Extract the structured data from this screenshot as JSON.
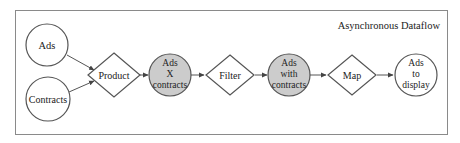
{
  "diagram": {
    "title": "Asynchronous Dataflow",
    "colors": {
      "border": "#888888",
      "stroke": "#555555",
      "highlight_fill": "#cccccc",
      "plain_fill": "#ffffff"
    },
    "nodes": [
      {
        "id": "ads",
        "shape": "circle",
        "lines": [
          "Ads"
        ],
        "highlight": false
      },
      {
        "id": "contracts",
        "shape": "circle",
        "lines": [
          "Contracts"
        ],
        "highlight": false
      },
      {
        "id": "product",
        "shape": "diamond",
        "lines": [
          "Product"
        ],
        "highlight": false
      },
      {
        "id": "ads-x-contracts",
        "shape": "circle",
        "lines": [
          "Ads",
          "X",
          "contracts"
        ],
        "highlight": true
      },
      {
        "id": "filter",
        "shape": "diamond",
        "lines": [
          "Filter"
        ],
        "highlight": false
      },
      {
        "id": "ads-with-contracts",
        "shape": "circle",
        "lines": [
          "Ads",
          "with",
          "contracts"
        ],
        "highlight": true
      },
      {
        "id": "map",
        "shape": "diamond",
        "lines": [
          "Map"
        ],
        "highlight": false
      },
      {
        "id": "ads-to-display",
        "shape": "circle",
        "lines": [
          "Ads",
          "to",
          "display"
        ],
        "highlight": false
      }
    ],
    "edges": [
      {
        "from": "ads",
        "to": "product"
      },
      {
        "from": "contracts",
        "to": "product"
      },
      {
        "from": "product",
        "to": "ads-x-contracts"
      },
      {
        "from": "ads-x-contracts",
        "to": "filter"
      },
      {
        "from": "filter",
        "to": "ads-with-contracts"
      },
      {
        "from": "ads-with-contracts",
        "to": "map"
      },
      {
        "from": "map",
        "to": "ads-to-display"
      }
    ]
  }
}
